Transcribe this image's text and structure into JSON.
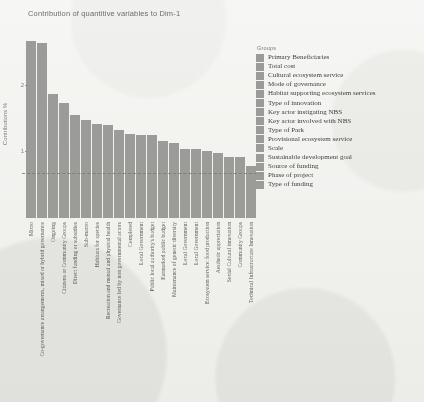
{
  "chart_data": {
    "type": "bar",
    "title": "Contribution of quantitive variables to Dim-1",
    "xlabel": "",
    "ylabel": "Contributions %",
    "ylim": [
      0,
      2.85
    ],
    "yticks": [
      1,
      2
    ],
    "ytick_labels": [
      "1",
      "2"
    ],
    "grid": false,
    "reference_line": {
      "value": 0.66,
      "style": "dashed",
      "label": ""
    },
    "legend": {
      "title": "Groups",
      "position": "right",
      "entries": [
        "Primary  Beneficiaries",
        "Total cost",
        "Cultural ecosystem service",
        "Mode of governance",
        "Habitat supporting ecosystem services",
        "Type of innovation",
        "Key actor instigating NBS",
        "Key actor involved with NBS",
        "Type of Park",
        "Provisional ecosystem service",
        "Scale",
        "Sustainable development goal",
        "Source of funding",
        "Phase of project",
        "Type of funding"
      ]
    },
    "categories": [
      "Micro",
      "Co-governance arrangements, mixed or hybrid governance",
      "Ongoing",
      "Citizens or Community Groups",
      "Direct funding or subsidies",
      "Sub-macro",
      "Habitats for species",
      "Recreation and mental and physical health",
      "Governance led by non governmental actors",
      "Completed",
      "Local Government",
      "Public local authority's budget",
      "Earmarked public budget",
      "Maintenance of genetic diversity",
      "Local Government",
      "Local Government",
      "Ecosystem service: food production",
      "Aesthetic appreciation",
      "Social Cultural innovation",
      "Community Groups",
      "Technical Infrastructure Innovation"
    ],
    "values": [
      2.66,
      2.63,
      1.86,
      1.73,
      1.55,
      1.47,
      1.41,
      1.4,
      1.32,
      1.26,
      1.24,
      1.24,
      1.16,
      1.12,
      1.04,
      1.03,
      1.0,
      0.97,
      0.92,
      0.92,
      0.78
    ],
    "bar_color": "#8e8e8c"
  }
}
